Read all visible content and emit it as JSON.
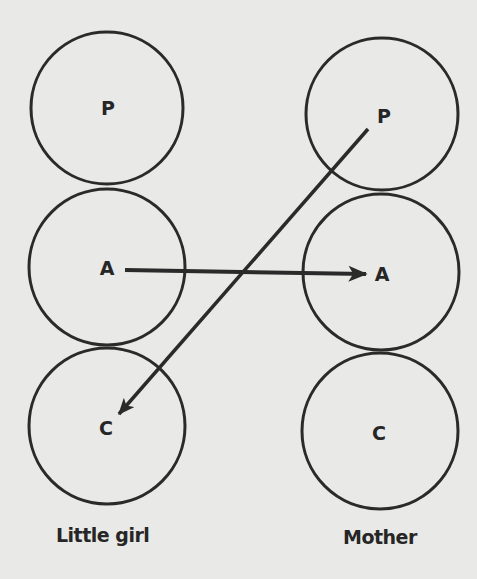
{
  "top_text_fragment": "",
  "colors": {
    "ink": "#2a2a2a",
    "background": "#e9e9e7"
  },
  "columns": [
    {
      "label": "Little girl",
      "nodes": [
        {
          "letter": "P",
          "cx": 107,
          "cy": 108,
          "r": 76
        },
        {
          "letter": "A",
          "cx": 107,
          "cy": 267,
          "r": 78
        },
        {
          "letter": "C",
          "cx": 107,
          "cy": 426,
          "r": 78
        }
      ]
    },
    {
      "label": "Mother",
      "nodes": [
        {
          "letter": "P",
          "cx": 382,
          "cy": 114,
          "r": 76
        },
        {
          "letter": "A",
          "cx": 381,
          "cy": 272,
          "r": 78
        },
        {
          "letter": "C",
          "cx": 380,
          "cy": 431,
          "r": 78
        }
      ]
    }
  ],
  "arrows": [
    {
      "from": "Little girl A",
      "to": "Mother A",
      "x1": 125,
      "y1": 270,
      "x2": 366,
      "y2": 274
    },
    {
      "from": "Mother P",
      "to": "Little girl C",
      "x1": 368,
      "y1": 129,
      "x2": 119,
      "y2": 414
    }
  ]
}
